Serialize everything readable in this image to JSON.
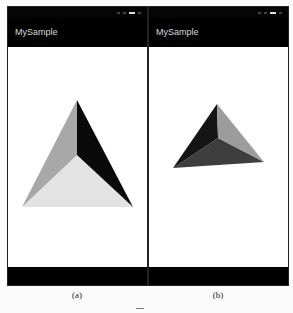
{
  "panels": [
    {
      "id": "a",
      "app_title": "MySample",
      "caption": "(a)",
      "pyramid": {
        "apex": [
          77,
          100
        ],
        "center": [
          77,
          155
        ],
        "left": [
          22,
          207
        ],
        "right": [
          133,
          207
        ],
        "face_colors": {
          "left": "#a8a8a8",
          "right": "#0a0a0a",
          "bottom": "#e3e3e3"
        }
      }
    },
    {
      "id": "b",
      "app_title": "MySample",
      "caption": "(b)",
      "pyramid": {
        "apex": [
          217,
          104
        ],
        "center": [
          218,
          138
        ],
        "left": [
          173,
          168
        ],
        "right": [
          264,
          162
        ],
        "face_colors": {
          "left": "#151515",
          "right": "#9c9c9c",
          "bottom": "#3e3e3e"
        }
      }
    }
  ]
}
